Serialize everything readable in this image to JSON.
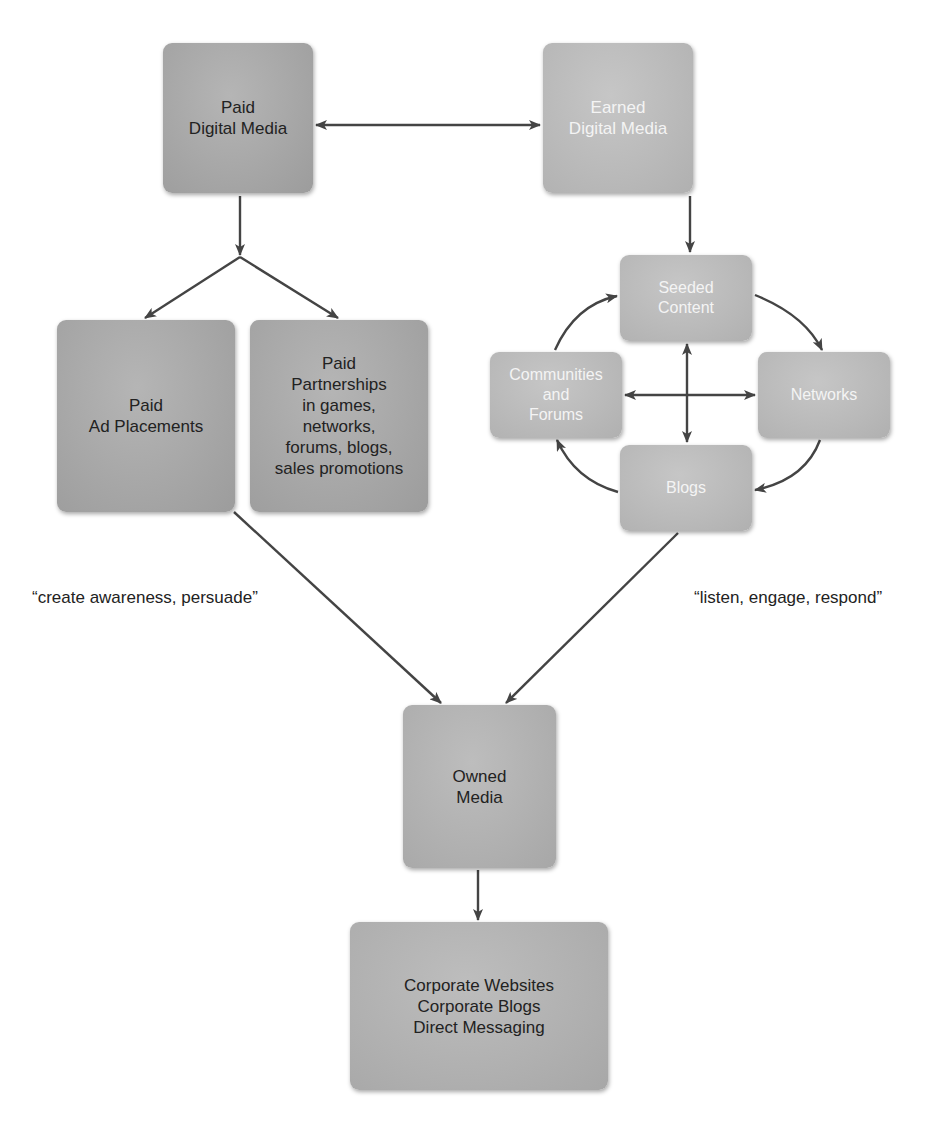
{
  "diagram": {
    "type": "flow-diagram",
    "colors": {
      "box_dark": "#a6a6a6",
      "box_light": "#b9b9b9",
      "arrow": "#444444",
      "text_dark": "#222222",
      "text_light": "#f4f4f4"
    },
    "nodes": {
      "paid_digital": {
        "lines": [
          "Paid",
          "Digital Media"
        ]
      },
      "earned_digital": {
        "lines": [
          "Earned",
          "Digital Media"
        ]
      },
      "paid_ad": {
        "lines": [
          "Paid",
          "Ad Placements"
        ]
      },
      "paid_partnerships": {
        "lines": [
          "Paid",
          "Partnerships",
          "in games,",
          "networks,",
          "forums, blogs,",
          "sales promotions"
        ]
      },
      "seeded_content": {
        "lines": [
          "Seeded",
          "Content"
        ]
      },
      "communities": {
        "lines": [
          "Communities",
          "and",
          "Forums"
        ]
      },
      "networks": {
        "lines": [
          "Networks"
        ]
      },
      "blogs": {
        "lines": [
          "Blogs"
        ]
      },
      "owned_media": {
        "lines": [
          "Owned",
          "Media"
        ]
      },
      "corporate": {
        "lines": [
          "Corporate Websites",
          "Corporate Blogs",
          "Direct Messaging"
        ]
      }
    },
    "captions": {
      "paid_side": "“create awareness, persuade”",
      "earned_side": "“listen, engage, respond”"
    },
    "edges": [
      {
        "from": "paid_digital",
        "to": "earned_digital",
        "bidirectional": true
      },
      {
        "from": "paid_digital",
        "to": "paid_ad"
      },
      {
        "from": "paid_digital",
        "to": "paid_partnerships"
      },
      {
        "from": "earned_digital",
        "to": "seeded_content"
      },
      {
        "from": "seeded_content",
        "to": "networks"
      },
      {
        "from": "networks",
        "to": "blogs"
      },
      {
        "from": "blogs",
        "to": "communities"
      },
      {
        "from": "communities",
        "to": "seeded_content"
      },
      {
        "from": "communities",
        "to": "networks",
        "bidirectional": true
      },
      {
        "from": "seeded_content",
        "to": "blogs",
        "bidirectional": true
      },
      {
        "from": "paid_ad",
        "to": "owned_media"
      },
      {
        "from": "blogs",
        "to": "owned_media"
      },
      {
        "from": "owned_media",
        "to": "corporate"
      }
    ]
  }
}
